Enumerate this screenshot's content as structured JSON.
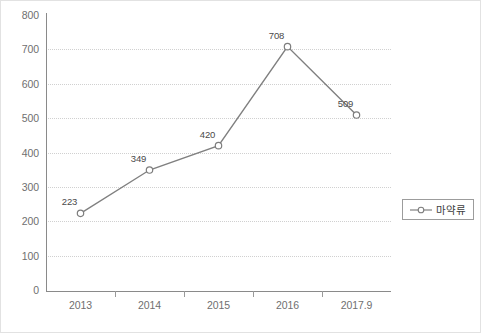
{
  "chart_data": {
    "type": "line",
    "title": "",
    "xlabel": "",
    "ylabel": "",
    "categories": [
      "2013",
      "2014",
      "2015",
      "2016",
      "2017.9"
    ],
    "series": [
      {
        "name": "마약류",
        "values": [
          223,
          349,
          420,
          708,
          509
        ],
        "marker": "open-circle",
        "color": "#808080"
      }
    ],
    "ylim": [
      0,
      800
    ],
    "yticks": [
      0,
      100,
      200,
      300,
      400,
      500,
      600,
      700,
      800
    ],
    "ytick_labels": [
      "0",
      "100",
      "200",
      "300",
      "400",
      "500",
      "600",
      "700",
      "800"
    ],
    "grid": "horizontal-dotted",
    "gridline_values": [
      100,
      200,
      300,
      400,
      500,
      600,
      700
    ],
    "data_labels": [
      "223",
      "349",
      "420",
      "708",
      "509"
    ],
    "legend": {
      "position": "right-middle",
      "entries": [
        "마약류"
      ]
    }
  },
  "colors": {
    "series_line": "#808080",
    "marker_stroke": "#7d7d7d",
    "marker_fill": "#ffffff",
    "gridline": "#d0d0d0",
    "axis": "#8a8a8a",
    "tick_text": "#6f6f6f",
    "label_text": "#4a4a4a",
    "legend_border": "#9c9c9c",
    "frame_border": "#e2e2e2",
    "background": "#ffffff"
  }
}
